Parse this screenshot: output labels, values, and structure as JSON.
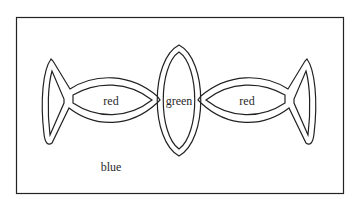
{
  "diagram": {
    "type": "region-coloring",
    "regions": [
      {
        "id": "left-fish",
        "label": "red"
      },
      {
        "id": "center-lens",
        "label": "green"
      },
      {
        "id": "right-fish",
        "label": "red"
      },
      {
        "id": "background",
        "label": "blue"
      }
    ],
    "colors": {
      "stroke": "#222222",
      "background": "#ffffff"
    }
  }
}
